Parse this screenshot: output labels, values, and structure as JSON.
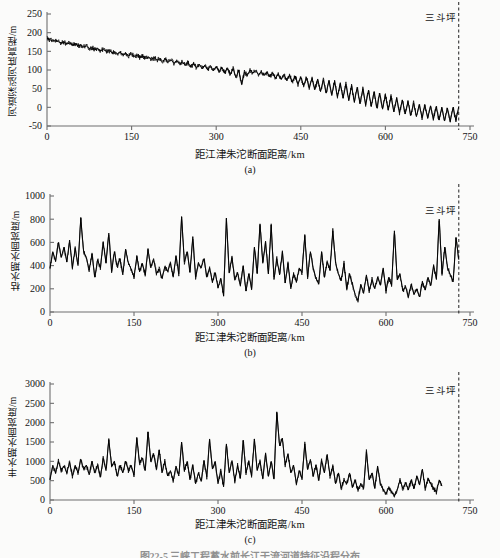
{
  "figure": {
    "caption": "图22-5  三峡工程蓄水前长江干流河道特征沿程分布",
    "background_color": "#fbfbfa",
    "line_color": "#000000",
    "axis_color": "#6f6f6f"
  },
  "marker": {
    "label": "三斗坪",
    "x_km": 730,
    "style": "dashed-vertical-line"
  },
  "shared": {
    "xlabel": "距江津朱沱断面距离/km",
    "xticks": [
      0,
      150,
      300,
      450,
      600,
      750
    ],
    "xlim": [
      0,
      750
    ]
  },
  "panels": [
    {
      "tag": "(a)",
      "ylabel": "河道深泓河底高程/m",
      "yticks": [
        -50,
        0,
        50,
        100,
        150,
        200,
        250
      ],
      "ylim": [
        -50,
        250
      ]
    },
    {
      "tag": "(b)",
      "ylabel": "枯水期水面宽度/m",
      "yticks": [
        0,
        200,
        400,
        600,
        800,
        1000
      ],
      "ylim": [
        0,
        1000
      ]
    },
    {
      "tag": "(c)",
      "ylabel": "丰水期水面宽度/m",
      "yticks": [
        0,
        500,
        1000,
        1500,
        2000,
        2500,
        3000
      ],
      "ylim": [
        0,
        3000
      ]
    }
  ],
  "chart_data": [
    {
      "type": "line",
      "title": "(a) 河道深泓河底高程",
      "xlabel": "距江津朱沱断面距离/km",
      "ylabel": "河道深泓河底高程/m",
      "xlim": [
        0,
        750
      ],
      "ylim": [
        -50,
        250
      ],
      "xticks": [
        0,
        150,
        300,
        450,
        600,
        750
      ],
      "yticks": [
        -50,
        0,
        50,
        100,
        150,
        200,
        250
      ],
      "grid": false,
      "legend": "none",
      "annotations": [
        {
          "text": "三斗坪",
          "x": 730,
          "type": "vertical-dashed-line"
        }
      ],
      "x": [
        0,
        5,
        10,
        15,
        20,
        25,
        30,
        35,
        40,
        45,
        50,
        55,
        60,
        65,
        70,
        75,
        80,
        85,
        90,
        95,
        100,
        105,
        110,
        115,
        120,
        125,
        130,
        135,
        140,
        145,
        150,
        155,
        160,
        165,
        170,
        175,
        180,
        185,
        190,
        195,
        200,
        205,
        210,
        215,
        220,
        225,
        230,
        235,
        240,
        245,
        250,
        255,
        260,
        265,
        270,
        275,
        280,
        285,
        290,
        295,
        300,
        305,
        310,
        315,
        320,
        325,
        330,
        335,
        340,
        345,
        350,
        355,
        360,
        365,
        370,
        375,
        380,
        385,
        390,
        395,
        400,
        405,
        410,
        415,
        420,
        425,
        430,
        435,
        440,
        445,
        450,
        455,
        460,
        465,
        470,
        475,
        480,
        485,
        490,
        495,
        500,
        505,
        510,
        515,
        520,
        525,
        530,
        535,
        540,
        545,
        550,
        555,
        560,
        565,
        570,
        575,
        580,
        585,
        590,
        595,
        600,
        605,
        610,
        615,
        620,
        625,
        630,
        635,
        640,
        645,
        650,
        655,
        660,
        665,
        670,
        675,
        680,
        685,
        690,
        695,
        700,
        705,
        710,
        715,
        720,
        725,
        730
      ],
      "values": [
        185,
        181,
        178,
        180,
        176,
        173,
        175,
        170,
        172,
        168,
        170,
        165,
        167,
        162,
        164,
        158,
        160,
        155,
        157,
        152,
        155,
        150,
        152,
        147,
        149,
        144,
        147,
        140,
        145,
        138,
        143,
        136,
        140,
        133,
        138,
        130,
        135,
        128,
        133,
        126,
        131,
        124,
        129,
        122,
        127,
        118,
        124,
        116,
        122,
        112,
        120,
        108,
        118,
        106,
        116,
        103,
        113,
        100,
        112,
        98,
        110,
        95,
        108,
        92,
        106,
        88,
        104,
        80,
        100,
        62,
        95,
        85,
        100,
        92,
        98,
        88,
        96,
        85,
        94,
        82,
        92,
        78,
        90,
        75,
        88,
        72,
        86,
        68,
        84,
        62,
        82,
        58,
        80,
        52,
        78,
        48,
        76,
        42,
        74,
        38,
        72,
        34,
        70,
        28,
        66,
        24,
        62,
        20,
        58,
        14,
        54,
        10,
        50,
        6,
        46,
        2,
        42,
        -2,
        38,
        -5,
        34,
        -8,
        30,
        -12,
        26,
        -15,
        20,
        -18,
        16,
        -22,
        12,
        -25,
        8,
        -28,
        6,
        -30,
        4,
        -32,
        2,
        -34,
        0,
        -36,
        -2,
        -38,
        0,
        -35,
        2,
        -30,
        5
      ],
      "value_range": [
        -38,
        185
      ],
      "description": "深泓河底高程自江津朱沱(约185 m)沿程递减至三斗坪(约0 m)，叠加高频起伏"
    },
    {
      "type": "line",
      "title": "(b) 枯水期水面宽度",
      "xlabel": "距江津朱沱断面距离/km",
      "ylabel": "枯水期水面宽度/m",
      "xlim": [
        0,
        750
      ],
      "ylim": [
        0,
        1000
      ],
      "xticks": [
        0,
        150,
        300,
        450,
        600,
        750
      ],
      "yticks": [
        0,
        200,
        400,
        600,
        800,
        1000
      ],
      "grid": false,
      "legend": "none",
      "annotations": [
        {
          "text": "三斗坪",
          "x": 730,
          "type": "vertical-dashed-line"
        }
      ],
      "x": [
        0,
        5,
        10,
        15,
        20,
        25,
        30,
        35,
        40,
        45,
        50,
        55,
        60,
        65,
        70,
        75,
        80,
        85,
        90,
        95,
        100,
        105,
        110,
        115,
        120,
        125,
        130,
        135,
        140,
        145,
        150,
        155,
        160,
        165,
        170,
        175,
        180,
        185,
        190,
        195,
        200,
        205,
        210,
        215,
        220,
        225,
        230,
        235,
        240,
        245,
        250,
        255,
        260,
        265,
        270,
        275,
        280,
        285,
        290,
        295,
        300,
        305,
        310,
        315,
        320,
        325,
        330,
        335,
        340,
        345,
        350,
        355,
        360,
        365,
        370,
        375,
        380,
        385,
        390,
        395,
        400,
        405,
        410,
        415,
        420,
        425,
        430,
        435,
        440,
        445,
        450,
        455,
        460,
        465,
        470,
        475,
        480,
        485,
        490,
        495,
        500,
        505,
        510,
        515,
        520,
        525,
        530,
        535,
        540,
        545,
        550,
        555,
        560,
        565,
        570,
        575,
        580,
        585,
        590,
        595,
        600,
        605,
        610,
        615,
        620,
        625,
        630,
        635,
        640,
        645,
        650,
        655,
        660,
        665,
        670,
        675,
        680,
        685,
        690,
        695,
        700,
        705,
        710,
        715,
        720,
        725,
        730
      ],
      "values": [
        380,
        520,
        440,
        600,
        470,
        560,
        430,
        620,
        380,
        550,
        400,
        810,
        520,
        470,
        360,
        500,
        300,
        450,
        380,
        600,
        420,
        680,
        350,
        520,
        390,
        460,
        320,
        540,
        420,
        370,
        300,
        480,
        350,
        420,
        320,
        540,
        380,
        460,
        330,
        370,
        290,
        390,
        350,
        420,
        300,
        480,
        330,
        820,
        430,
        520,
        340,
        650,
        300,
        420,
        380,
        460,
        300,
        380,
        260,
        340,
        210,
        290,
        140,
        810,
        340,
        470,
        280,
        340,
        230,
        400,
        180,
        330,
        200,
        560,
        330,
        760,
        420,
        600,
        330,
        750,
        280,
        460,
        320,
        520,
        250,
        420,
        200,
        330,
        260,
        380,
        340,
        660,
        300,
        520,
        380,
        290,
        240,
        520,
        300,
        430,
        360,
        700,
        420,
        330,
        270,
        420,
        200,
        330,
        240,
        150,
        100,
        240,
        160,
        320,
        180,
        280,
        200,
        300,
        230,
        380,
        180,
        300,
        230,
        700,
        280,
        330,
        180,
        220,
        130,
        240,
        150,
        200,
        130,
        260,
        190,
        300,
        230,
        400,
        280,
        800,
        330,
        560,
        380,
        320,
        260,
        640,
        450
      ],
      "value_range": [
        100,
        820
      ],
      "description": "枯水期水面宽度沿程在100~820 m间高频震荡，500~650 km段整体偏窄，近坝段回升"
    },
    {
      "type": "line",
      "title": "(c) 丰水期水面宽度",
      "xlabel": "距江津朱沱断面距离/km",
      "ylabel": "丰水期水面宽度/m",
      "xlim": [
        0,
        750
      ],
      "ylim": [
        0,
        3000
      ],
      "xticks": [
        0,
        150,
        300,
        450,
        600,
        750
      ],
      "yticks": [
        0,
        500,
        1000,
        1500,
        2000,
        2500,
        3000
      ],
      "grid": false,
      "legend": "none",
      "annotations": [
        {
          "text": "三斗坪",
          "x": 730,
          "type": "vertical-dashed-line"
        }
      ],
      "x": [
        0,
        5,
        10,
        15,
        20,
        25,
        30,
        35,
        40,
        45,
        50,
        55,
        60,
        65,
        70,
        75,
        80,
        85,
        90,
        95,
        100,
        105,
        110,
        115,
        120,
        125,
        130,
        135,
        140,
        145,
        150,
        155,
        160,
        165,
        170,
        175,
        180,
        185,
        190,
        195,
        200,
        205,
        210,
        215,
        220,
        225,
        230,
        235,
        240,
        245,
        250,
        255,
        260,
        265,
        270,
        275,
        280,
        285,
        290,
        295,
        300,
        305,
        310,
        315,
        320,
        325,
        330,
        335,
        340,
        345,
        350,
        355,
        360,
        365,
        370,
        375,
        380,
        385,
        390,
        395,
        400,
        405,
        410,
        415,
        420,
        425,
        430,
        435,
        440,
        445,
        450,
        455,
        460,
        465,
        470,
        475,
        480,
        485,
        490,
        495,
        500,
        505,
        510,
        515,
        520,
        525,
        530,
        535,
        540,
        545,
        550,
        555,
        560,
        565,
        570,
        575,
        580,
        585,
        590,
        595,
        600,
        605,
        610,
        615,
        620,
        625,
        630,
        635,
        640,
        645,
        650,
        655,
        660,
        665,
        670,
        675,
        680,
        685,
        690,
        695,
        700,
        705,
        710,
        715,
        720,
        725,
        730
      ],
      "values": [
        520,
        900,
        700,
        1000,
        760,
        880,
        700,
        980,
        620,
        900,
        700,
        1050,
        800,
        900,
        650,
        1000,
        700,
        900,
        600,
        1080,
        760,
        1560,
        880,
        1000,
        620,
        900,
        700,
        1000,
        760,
        900,
        640,
        1620,
        950,
        1080,
        760,
        1760,
        1000,
        1200,
        800,
        1300,
        700,
        1000,
        620,
        760,
        500,
        880,
        620,
        1500,
        760,
        1000,
        520,
        900,
        420,
        700,
        480,
        1020,
        600,
        1560,
        800,
        1000,
        420,
        760,
        340,
        1450,
        700,
        1020,
        480,
        900,
        560,
        1550,
        700,
        1000,
        620,
        1580,
        760,
        1000,
        560,
        1200,
        620,
        1000,
        540,
        2280,
        1400,
        1600,
        900,
        1200,
        700,
        900,
        420,
        760,
        560,
        1450,
        800,
        1050,
        620,
        900,
        500,
        1020,
        700,
        1180,
        620,
        880,
        420,
        700,
        300,
        520,
        420,
        700,
        340,
        500,
        260,
        420,
        300,
        1250,
        520,
        700,
        300,
        880,
        420,
        260,
        160,
        320,
        200,
        100,
        260,
        520,
        300,
        440,
        260,
        520,
        300,
        620,
        400,
        800,
        300,
        560,
        420,
        300,
        200,
        520,
        360
      ],
      "value_range": [
        100,
        2280
      ],
      "description": "丰水期水面宽度在100~2280 m间剧烈波动，约420 km处出现最大值2280 m，600 km以后显著变窄"
    }
  ]
}
